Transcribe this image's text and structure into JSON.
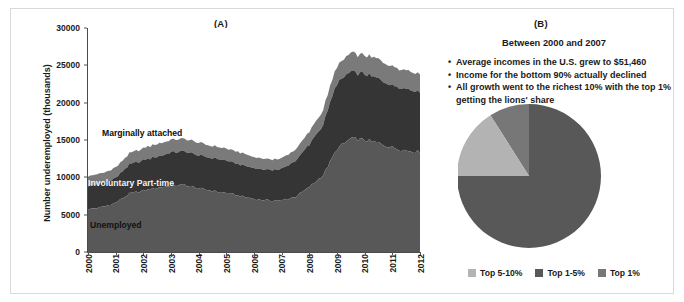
{
  "figure": {
    "background": "#ffffff",
    "frame_color": "#d9d9d9"
  },
  "panel_a": {
    "tag": "(A)",
    "ylabel": "Number underemployed (thousands)",
    "yticks": [
      "0",
      "5000",
      "10000",
      "15000",
      "20000",
      "25000",
      "30000"
    ],
    "xticks": [
      "2000",
      "2001",
      "2002",
      "2003",
      "2004",
      "2005",
      "2006",
      "2007",
      "2008",
      "2009",
      "2010",
      "2011",
      "2012"
    ],
    "area_labels": {
      "marginally_attached": "Marginally attached",
      "involuntary_part_time": "Involuntary Part-time",
      "unemployed": "Unemployed"
    },
    "colors": {
      "marginally_attached": "#7a7a7a",
      "involuntary_part_time": "#353535",
      "unemployed": "#585858",
      "axis": "#4a4a4a"
    }
  },
  "panel_b": {
    "tag": "(B)",
    "heading": "Between 2000 and 2007",
    "bullets": [
      "Average incomes in the U.S. grew to $51,460",
      "Income for the bottom 90% actually declined",
      "All growth went to the richest 10% with the top 1% getting the lions' share"
    ],
    "legend": [
      {
        "label": "Top 5-10%",
        "color": "#b3b3b3"
      },
      {
        "label": "Top 1-5%",
        "color": "#585858"
      },
      {
        "label": "Top 1%",
        "color": "#777777"
      }
    ]
  },
  "chart_data": [
    {
      "type": "area",
      "id": "panel-a-stacked-area",
      "title": "(A)",
      "xlabel": "",
      "ylabel": "Number underemployed (thousands)",
      "ylim": [
        0,
        30000
      ],
      "yticks": [
        0,
        5000,
        10000,
        15000,
        20000,
        25000,
        30000
      ],
      "grid": false,
      "legend": "inline-labels",
      "stacked": true,
      "x": [
        "2000",
        "2000.5",
        "2001",
        "2001.5",
        "2002",
        "2002.5",
        "2003",
        "2003.5",
        "2004",
        "2004.5",
        "2005",
        "2005.5",
        "2006",
        "2006.5",
        "2007",
        "2007.5",
        "2008",
        "2008.5",
        "2009",
        "2009.5",
        "2010",
        "2010.5",
        "2011",
        "2011.5",
        "2012"
      ],
      "series": [
        {
          "name": "Unemployed",
          "color": "#585858",
          "values": [
            5700,
            6000,
            6600,
            7800,
            8200,
            8600,
            8900,
            9000,
            8500,
            8200,
            7900,
            7500,
            7100,
            6900,
            6900,
            7400,
            8700,
            10300,
            13800,
            15200,
            15000,
            14600,
            14000,
            13600,
            13400
          ]
        },
        {
          "name": "Involuntary Part-time",
          "color": "#353535",
          "values": [
            3200,
            3200,
            3300,
            3900,
            4100,
            4200,
            4400,
            4500,
            4400,
            4400,
            4300,
            4200,
            4100,
            4100,
            4200,
            4800,
            5700,
            6800,
            8800,
            9000,
            8800,
            8600,
            8400,
            8300,
            8100
          ]
        },
        {
          "name": "Marginally attached",
          "color": "#7a7a7a",
          "values": [
            1300,
            1300,
            1400,
            1500,
            1600,
            1700,
            1700,
            1700,
            1700,
            1600,
            1600,
            1600,
            1500,
            1400,
            1400,
            1500,
            1700,
            2000,
            2300,
            2500,
            2500,
            2600,
            2500,
            2500,
            2400
          ]
        }
      ],
      "totals_note": "Peak stacked total approx 26500 thousand in 2009-2010"
    },
    {
      "type": "pie",
      "id": "panel-b-income-growth-share",
      "title": "(B)",
      "subtitle": "Between 2000 and 2007",
      "start_angle_deg": 90,
      "direction": "counterclockwise",
      "labels": [
        "Top 1%",
        "Top 5-10%",
        "Top 1-5%"
      ],
      "values": [
        9,
        16,
        75
      ],
      "colors": [
        "#777777",
        "#b3b3b3",
        "#585858"
      ],
      "legend_position": "bottom",
      "legend_order": [
        "Top 5-10%",
        "Top 1-5%",
        "Top 1%"
      ]
    }
  ]
}
